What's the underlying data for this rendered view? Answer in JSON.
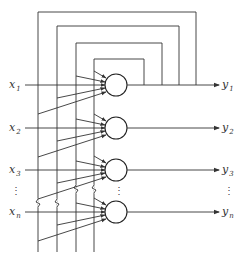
{
  "diagram": {
    "type": "Hopfield-style recurrent neural network",
    "colors": {
      "line": "#333333",
      "background": "#ffffff"
    },
    "inputs": [
      {
        "base": "x",
        "sub": "1",
        "y": 85
      },
      {
        "base": "x",
        "sub": "2",
        "y": 128
      },
      {
        "base": "x",
        "sub": "3",
        "y": 170
      },
      {
        "base": "x",
        "sub": "n",
        "y": 212
      }
    ],
    "outputs": [
      {
        "base": "y",
        "sub": "1",
        "y": 85
      },
      {
        "base": "y",
        "sub": "2",
        "y": 128
      },
      {
        "base": "y",
        "sub": "3",
        "y": 170
      },
      {
        "base": "y",
        "sub": "n",
        "y": 212
      }
    ],
    "ellipsis": "⋮",
    "neuron_count_shown": 4,
    "feedback_loops": 4
  }
}
